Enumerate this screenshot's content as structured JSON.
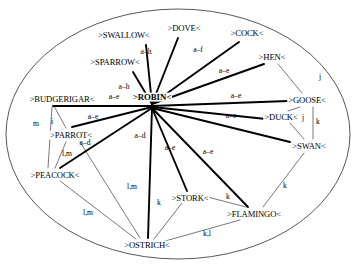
{
  "diagram": {
    "boundary": {
      "shape": "ellipse",
      "cx": 178,
      "cy": 134,
      "rx": 172,
      "ry": 125
    },
    "nodes": [
      {
        "id": "robin",
        "label": ">ROBIN<",
        "x": 152,
        "y": 97,
        "hub": true
      },
      {
        "id": "swallow",
        "label": ">SWALLOW<",
        "x": 124,
        "y": 35,
        "hub": false
      },
      {
        "id": "dove",
        "label": ">DOVE<",
        "x": 184,
        "y": 28,
        "hub": false
      },
      {
        "id": "cock",
        "label": ">COCK<",
        "x": 247,
        "y": 33,
        "hub": false
      },
      {
        "id": "hen",
        "label": ">HEN<",
        "x": 272,
        "y": 57,
        "hub": false
      },
      {
        "id": "sparrow",
        "label": ">SPARROW<",
        "x": 115,
        "y": 62,
        "hub": false
      },
      {
        "id": "budgerigar",
        "label": ">BUDGERIGAR<",
        "x": 62,
        "y": 99,
        "hub": false
      },
      {
        "id": "goose",
        "label": ">GOOSE<",
        "x": 307,
        "y": 100,
        "hub": false
      },
      {
        "id": "duck",
        "label": ">DUCK<",
        "x": 281,
        "y": 117,
        "hub": false
      },
      {
        "id": "parrot",
        "label": ">PARROT<",
        "x": 71,
        "y": 135,
        "hub": false
      },
      {
        "id": "swan",
        "label": ">SWAN<",
        "x": 309,
        "y": 146,
        "hub": false
      },
      {
        "id": "peacock",
        "label": ">PEACOCK<",
        "x": 55,
        "y": 175,
        "hub": false
      },
      {
        "id": "stork",
        "label": ">STORK<",
        "x": 190,
        "y": 198,
        "hub": false
      },
      {
        "id": "flamingo",
        "label": ">FLAMINGO<",
        "x": 254,
        "y": 214,
        "hub": false
      },
      {
        "id": "ostrich",
        "label": ">OSTRICH<",
        "x": 147,
        "y": 245,
        "hub": false
      }
    ],
    "thick_edges": [
      {
        "id": "robin-swallow",
        "from": "robin",
        "to": "swallow",
        "x1": 152,
        "y1": 104,
        "x2": 146,
        "y2": 45
      },
      {
        "id": "robin-dove",
        "from": "robin",
        "to": "dove",
        "x1": 152,
        "y1": 104,
        "x2": 178,
        "y2": 38
      },
      {
        "id": "robin-cock",
        "from": "robin",
        "to": "cock",
        "x1": 152,
        "y1": 104,
        "x2": 239,
        "y2": 42
      },
      {
        "id": "robin-hen",
        "from": "robin",
        "to": "hen",
        "x1": 152,
        "y1": 104,
        "x2": 264,
        "y2": 64
      },
      {
        "id": "robin-sparrow",
        "from": "robin",
        "to": "sparrow",
        "x1": 152,
        "y1": 104,
        "x2": 133,
        "y2": 72
      },
      {
        "id": "robin-goose",
        "from": "robin",
        "to": "goose",
        "x1": 152,
        "y1": 106,
        "x2": 288,
        "y2": 101
      },
      {
        "id": "robin-budgerigar",
        "from": "robin",
        "to": "budgerigar",
        "x1": 152,
        "y1": 106,
        "x2": 53,
        "y2": 106
      },
      {
        "id": "robin-duck",
        "from": "robin",
        "to": "duck",
        "x1": 152,
        "y1": 107,
        "x2": 266,
        "y2": 119
      },
      {
        "id": "robin-parrot",
        "from": "robin",
        "to": "parrot",
        "x1": 152,
        "y1": 107,
        "x2": 72,
        "y2": 127
      },
      {
        "id": "robin-swan",
        "from": "robin",
        "to": "swan",
        "x1": 152,
        "y1": 108,
        "x2": 290,
        "y2": 142
      },
      {
        "id": "robin-peacock",
        "from": "robin",
        "to": "peacock",
        "x1": 152,
        "y1": 108,
        "x2": 60,
        "y2": 168
      },
      {
        "id": "robin-ostrich",
        "from": "robin",
        "to": "ostrich",
        "x1": 152,
        "y1": 108,
        "x2": 148,
        "y2": 238
      },
      {
        "id": "robin-stork",
        "from": "robin",
        "to": "stork",
        "x1": 152,
        "y1": 108,
        "x2": 187,
        "y2": 191
      },
      {
        "id": "robin-flamingo",
        "from": "robin",
        "to": "flamingo",
        "x1": 152,
        "y1": 108,
        "x2": 248,
        "y2": 207
      }
    ],
    "thin_edges": [
      {
        "id": "budgerigar-parrot",
        "from": "budgerigar",
        "to": "parrot",
        "x1": 54,
        "y1": 106,
        "x2": 66,
        "y2": 128
      },
      {
        "id": "budgerigar-peacock",
        "from": "budgerigar",
        "to": "peacock",
        "x1": 52,
        "y1": 107,
        "x2": 48,
        "y2": 168
      },
      {
        "id": "parrot-peacock",
        "from": "parrot",
        "to": "peacock",
        "x1": 66,
        "y1": 142,
        "x2": 55,
        "y2": 168
      },
      {
        "id": "parrot-ostrich",
        "from": "parrot",
        "to": "ostrich",
        "x1": 80,
        "y1": 142,
        "x2": 140,
        "y2": 238
      },
      {
        "id": "peacock-ostrich",
        "from": "peacock",
        "to": "ostrich",
        "x1": 60,
        "y1": 181,
        "x2": 136,
        "y2": 239
      },
      {
        "id": "goose-duck",
        "from": "goose",
        "to": "duck",
        "x1": 300,
        "y1": 107,
        "x2": 288,
        "y2": 111
      },
      {
        "id": "hen-goose",
        "from": "hen",
        "to": "goose",
        "x1": 278,
        "y1": 64,
        "x2": 302,
        "y2": 93
      },
      {
        "id": "duck-swan",
        "from": "duck",
        "to": "swan",
        "x1": 290,
        "y1": 123,
        "x2": 304,
        "y2": 139
      },
      {
        "id": "goose-swan",
        "from": "goose",
        "to": "swan",
        "x1": 313,
        "y1": 107,
        "x2": 313,
        "y2": 139
      },
      {
        "id": "swan-flamingo",
        "from": "swan",
        "to": "flamingo",
        "x1": 304,
        "y1": 153,
        "x2": 263,
        "y2": 207
      },
      {
        "id": "stork-flamingo",
        "from": "stork",
        "to": "flamingo",
        "x1": 196,
        "y1": 194,
        "x2": 246,
        "y2": 207
      },
      {
        "id": "stork-ostrich",
        "from": "stork",
        "to": "ostrich",
        "x1": 182,
        "y1": 203,
        "x2": 154,
        "y2": 239
      },
      {
        "id": "ostrich-flamingo",
        "from": "ostrich",
        "to": "flamingo",
        "x1": 158,
        "y1": 243,
        "x2": 240,
        "y2": 220
      }
    ],
    "edge_labels": [
      {
        "id": "lbl-swallow",
        "text": "a–h",
        "x": 146,
        "y": 52
      },
      {
        "id": "lbl-dove",
        "text": "a–f",
        "x": 198,
        "y": 50
      },
      {
        "id": "lbl-cock-hen",
        "text": "a–e",
        "x": 224,
        "y": 71
      },
      {
        "id": "lbl-sparrow",
        "text": "a–h",
        "x": 124,
        "y": 87
      },
      {
        "id": "lbl-budgerigar",
        "text": "a–e",
        "x": 114,
        "y": 97
      },
      {
        "id": "lbl-goose",
        "text": "a–e",
        "x": 236,
        "y": 96
      },
      {
        "id": "lbl-parrot",
        "text": "a–e",
        "x": 93,
        "y": 117
      },
      {
        "id": "lbl-duck",
        "text": "a–e",
        "x": 231,
        "y": 116
      },
      {
        "id": "lbl-peacock",
        "text": "a–d",
        "x": 85,
        "y": 143
      },
      {
        "id": "lbl-ostrich",
        "text": "a–d",
        "x": 140,
        "y": 136
      },
      {
        "id": "lbl-stork",
        "text": "a–e",
        "x": 170,
        "y": 148
      },
      {
        "id": "lbl-flamingo",
        "text": "a–e",
        "x": 208,
        "y": 152
      },
      {
        "id": "lbl-hen-goose",
        "text": "j",
        "x": 320,
        "y": 77
      },
      {
        "id": "lbl-goose-duck",
        "text": "j",
        "x": 303,
        "y": 118
      },
      {
        "id": "lbl-goose-swan",
        "text": "k",
        "x": 318,
        "y": 122
      },
      {
        "id": "lbl-bud-peacock",
        "text": "m",
        "x": 36,
        "y": 124
      },
      {
        "id": "lbl-bud-parrot",
        "text": "i",
        "x": 52,
        "y": 122
      },
      {
        "id": "lbl-parrot-pea",
        "text": "l,m",
        "x": 67,
        "y": 154
      },
      {
        "id": "lbl-parrot-ost",
        "text": "l,m",
        "x": 132,
        "y": 187
      },
      {
        "id": "lbl-pea-ostrich",
        "text": "l,m",
        "x": 88,
        "y": 213
      },
      {
        "id": "lbl-stork-ost",
        "text": "k",
        "x": 159,
        "y": 203
      },
      {
        "id": "lbl-stork-flam",
        "text": "k",
        "x": 228,
        "y": 197
      },
      {
        "id": "lbl-swan-flam",
        "text": "k",
        "x": 285,
        "y": 186
      },
      {
        "id": "lbl-ost-flam",
        "text": "k,l",
        "x": 207,
        "y": 234
      }
    ]
  }
}
